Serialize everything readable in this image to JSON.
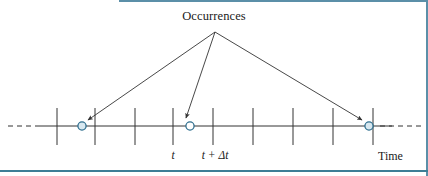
{
  "figure": {
    "title": "Occurrences",
    "axis_label": "Time",
    "labels": {
      "t": "t",
      "t_plus_delta_t": "t + Δt"
    },
    "colors": {
      "line": "#333333",
      "marker_stroke": "#2e6e8e",
      "marker_fill": "#d8e8f0",
      "accent_rule": "#3d7e96",
      "text": "#1a1a1a",
      "background": "#ffffff"
    }
  },
  "chart_data": {
    "type": "scatter",
    "title": "Occurrences",
    "xlabel": "Time",
    "ylabel": "",
    "grid": false,
    "legend": null,
    "axis": {
      "orientation": "horizontal",
      "y_pixel": 126,
      "solid_from_x": 38,
      "solid_to_x": 392,
      "dashed_left_from_x": 8,
      "dashed_left_to_x": 38,
      "dashed_right_from_x": 380,
      "dashed_right_to_x": 422,
      "ticks_x": [
        57,
        95,
        135,
        173,
        213,
        253,
        293,
        333,
        373
      ],
      "tick_top_y": 108,
      "tick_bottom_y": 145,
      "tick_labels": [
        "",
        "",
        "",
        "t",
        "t + Δt",
        "",
        "",
        "",
        ""
      ]
    },
    "occurrences": [
      {
        "name": "occurrence-1",
        "x": 82,
        "y": 126
      },
      {
        "name": "occurrence-2",
        "x": 190,
        "y": 126
      },
      {
        "name": "occurrence-3",
        "x": 369,
        "y": 126
      }
    ],
    "annotation": {
      "text": "Occurrences",
      "apex_x": 215,
      "apex_y": 32,
      "arrow_targets": [
        {
          "x": 88,
          "y": 120
        },
        {
          "x": 186,
          "y": 118
        },
        {
          "x": 362,
          "y": 120
        }
      ]
    }
  }
}
